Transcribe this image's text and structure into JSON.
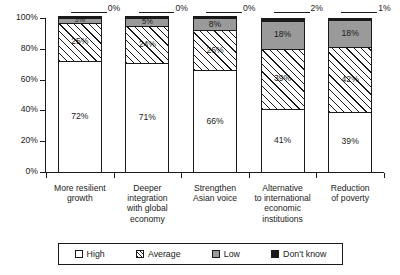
{
  "chart_data": {
    "type": "bar",
    "subtype": "stacked-bar-100-percent",
    "title": "",
    "subtitle": "",
    "xlabel": "",
    "ylabel": "",
    "ylim": [
      0,
      100
    ],
    "ytick_labels": [
      "0%",
      "20%",
      "40%",
      "60%",
      "80%",
      "100%"
    ],
    "ytick_values": [
      0,
      20,
      40,
      60,
      80,
      100
    ],
    "grid": false,
    "legend_position": "bottom",
    "categories": [
      "More resilient growth",
      "Deeper integration with global economy",
      "Strengthen Asian voice",
      "Alternative to international economic institutions",
      "Reduction of poverty"
    ],
    "category_lines": [
      [
        "More resilient",
        "growth"
      ],
      [
        "Deeper",
        "integration",
        "with global",
        "economy"
      ],
      [
        "Strengthen",
        "Asian voice"
      ],
      [
        "Alternative",
        "to international",
        "economic",
        "institutions"
      ],
      [
        "Reduction",
        "of poverty"
      ]
    ],
    "series": [
      {
        "name": "High",
        "values": [
          72,
          71,
          66,
          41,
          39
        ],
        "labels": [
          "72%",
          "71%",
          "66%",
          "41%",
          "39%"
        ]
      },
      {
        "name": "Average",
        "values": [
          25,
          24,
          26,
          39,
          42
        ],
        "labels": [
          "25%",
          "24%",
          "26%",
          "39%",
          "42%"
        ]
      },
      {
        "name": "Low",
        "values": [
          3,
          5,
          8,
          18,
          18
        ],
        "labels": [
          "3%",
          "5%",
          "8%",
          "18%",
          "18%"
        ]
      },
      {
        "name": "Don't know",
        "values": [
          0,
          0,
          0,
          2,
          1
        ],
        "labels": [
          "0%",
          "0%",
          "0%",
          "2%",
          "1%"
        ]
      }
    ]
  },
  "legend": {
    "items": [
      {
        "label": "High",
        "swatch": "white-square-icon"
      },
      {
        "label": "Average",
        "swatch": "hatched-square-icon"
      },
      {
        "label": "Low",
        "swatch": "gray-square-icon"
      },
      {
        "label": "Don't know",
        "swatch": "black-square-icon"
      }
    ]
  }
}
